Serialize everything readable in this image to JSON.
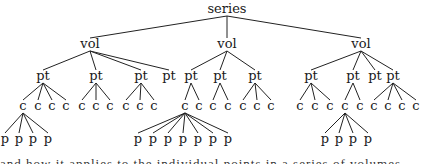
{
  "diagram": {
    "type": "tree",
    "root": {
      "label": "series",
      "x": 227,
      "y": 13,
      "children": [
        {
          "label": "vol",
          "x": 90,
          "y": 48,
          "children": [
            {
              "label": "pt",
              "x": 43,
              "y": 80,
              "children": [
                {
                  "label": "c",
                  "x": 23,
                  "y": 110,
                  "children": [
                    {
                      "label": "p",
                      "x": 5,
                      "y": 143
                    },
                    {
                      "label": "p",
                      "x": 19,
                      "y": 143
                    },
                    {
                      "label": "p",
                      "x": 33,
                      "y": 143
                    },
                    {
                      "label": "p",
                      "x": 48,
                      "y": 143
                    }
                  ]
                },
                {
                  "label": "c",
                  "x": 38,
                  "y": 110,
                  "children": []
                },
                {
                  "label": "c",
                  "x": 52,
                  "y": 110,
                  "children": []
                },
                {
                  "label": "c",
                  "x": 66,
                  "y": 110,
                  "children": []
                }
              ]
            },
            {
              "label": "pt",
              "x": 96,
              "y": 80,
              "children": [
                {
                  "label": "c",
                  "x": 82,
                  "y": 110,
                  "children": []
                },
                {
                  "label": "c",
                  "x": 96,
                  "y": 110,
                  "children": []
                },
                {
                  "label": "c",
                  "x": 110,
                  "y": 110,
                  "children": []
                }
              ]
            },
            {
              "label": "pt",
              "x": 141,
              "y": 80,
              "children": [
                {
                  "label": "c",
                  "x": 126,
                  "y": 110,
                  "children": []
                },
                {
                  "label": "c",
                  "x": 140,
                  "y": 110,
                  "children": []
                },
                {
                  "label": "c",
                  "x": 154,
                  "y": 110,
                  "children": []
                }
              ]
            },
            {
              "label": "pt",
              "x": 169,
              "y": 80,
              "children": []
            }
          ]
        },
        {
          "label": "vol",
          "x": 227,
          "y": 48,
          "children": [
            {
              "label": "pt",
              "x": 191,
              "y": 80,
              "children": [
                {
                  "label": "c",
                  "x": 185,
                  "y": 110,
                  "children": [
                    {
                      "label": "p",
                      "x": 138,
                      "y": 143
                    },
                    {
                      "label": "p",
                      "x": 153,
                      "y": 143
                    },
                    {
                      "label": "p",
                      "x": 168,
                      "y": 143
                    },
                    {
                      "label": "p",
                      "x": 183,
                      "y": 143
                    },
                    {
                      "label": "p",
                      "x": 198,
                      "y": 143
                    },
                    {
                      "label": "p",
                      "x": 213,
                      "y": 143
                    },
                    {
                      "label": "p",
                      "x": 228,
                      "y": 143
                    }
                  ]
                },
                {
                  "label": "c",
                  "x": 199,
                  "y": 110,
                  "children": []
                }
              ]
            },
            {
              "label": "pt",
              "x": 220,
              "y": 80,
              "children": [
                {
                  "label": "c",
                  "x": 213,
                  "y": 110,
                  "children": []
                },
                {
                  "label": "c",
                  "x": 228,
                  "y": 110,
                  "children": []
                }
              ]
            },
            {
              "label": "pt",
              "x": 255,
              "y": 80,
              "children": [
                {
                  "label": "c",
                  "x": 243,
                  "y": 110,
                  "children": []
                },
                {
                  "label": "c",
                  "x": 257,
                  "y": 110,
                  "children": []
                },
                {
                  "label": "c",
                  "x": 271,
                  "y": 110,
                  "children": []
                }
              ]
            }
          ]
        },
        {
          "label": "vol",
          "x": 361,
          "y": 48,
          "children": [
            {
              "label": "pt",
              "x": 311,
              "y": 80,
              "children": [
                {
                  "label": "c",
                  "x": 300,
                  "y": 110,
                  "children": []
                },
                {
                  "label": "c",
                  "x": 315,
                  "y": 110,
                  "children": []
                },
                {
                  "label": "c",
                  "x": 330,
                  "y": 110,
                  "children": []
                }
              ]
            },
            {
              "label": "pt",
              "x": 353,
              "y": 80,
              "children": [
                {
                  "label": "c",
                  "x": 345,
                  "y": 110,
                  "children": [
                    {
                      "label": "p",
                      "x": 325,
                      "y": 143
                    },
                    {
                      "label": "p",
                      "x": 339,
                      "y": 143
                    },
                    {
                      "label": "p",
                      "x": 353,
                      "y": 143
                    },
                    {
                      "label": "p",
                      "x": 368,
                      "y": 143
                    }
                  ]
                },
                {
                  "label": "c",
                  "x": 360,
                  "y": 110,
                  "children": []
                }
              ]
            },
            {
              "label": "pt",
              "x": 375,
              "y": 80,
              "children": []
            },
            {
              "label": "pt",
              "x": 393,
              "y": 80,
              "children": [
                {
                  "label": "c",
                  "x": 374,
                  "y": 110,
                  "children": []
                },
                {
                  "label": "c",
                  "x": 388,
                  "y": 110,
                  "children": []
                },
                {
                  "label": "c",
                  "x": 402,
                  "y": 110,
                  "children": []
                },
                {
                  "label": "c",
                  "x": 416,
                  "y": 110,
                  "children": []
                }
              ]
            }
          ]
        }
      ]
    }
  },
  "clipped_text_line": "partially visible line of text (cut off at bottom edge)"
}
